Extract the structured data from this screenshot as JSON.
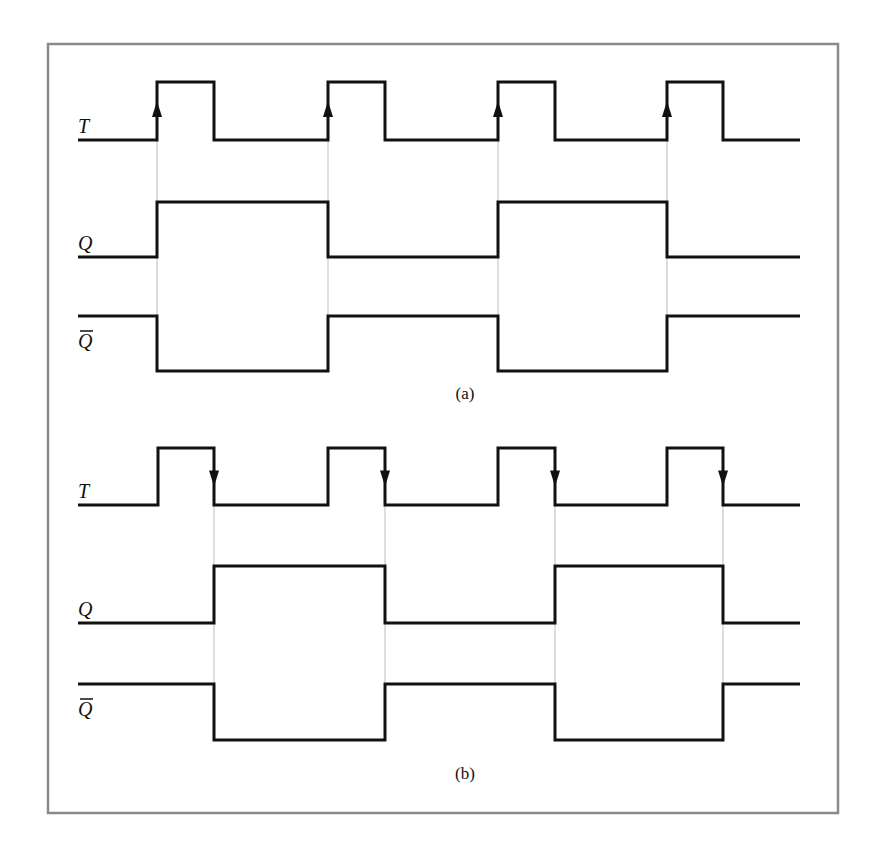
{
  "frame": {
    "x": 48,
    "y": 44,
    "width": 790,
    "height": 769,
    "stroke": "#8a8a8a"
  },
  "signal_x_start": 78,
  "signal_x_end": 800,
  "panels": [
    {
      "caption": "(a)",
      "caption_pos": {
        "x": 465,
        "y": 399
      },
      "trigger": "rising-edge",
      "clock_edges": [
        157,
        328,
        498,
        667
      ],
      "signals": [
        {
          "label": "T",
          "label_pos": {
            "x": 78,
            "y": 133
          },
          "bar": false,
          "high_y": 82,
          "low_y": 140,
          "initial": 0,
          "transitions": [
            157,
            214,
            328,
            385,
            498,
            555,
            667,
            723
          ]
        },
        {
          "label": "Q",
          "label_pos": {
            "x": 78,
            "y": 250
          },
          "bar": false,
          "high_y": 202,
          "low_y": 257,
          "initial": 0,
          "transitions": [
            157,
            328,
            498,
            667
          ]
        },
        {
          "label": "Q",
          "label_pos": {
            "x": 78,
            "y": 348
          },
          "bar": true,
          "high_y": 316,
          "low_y": 371,
          "initial": 1,
          "transitions": [
            157,
            328,
            498,
            667
          ]
        }
      ]
    },
    {
      "caption": "(b)",
      "caption_pos": {
        "x": 465,
        "y": 779
      },
      "trigger": "falling-edge",
      "clock_edges": [
        214,
        385,
        555,
        723
      ],
      "signals": [
        {
          "label": "T",
          "label_pos": {
            "x": 78,
            "y": 498
          },
          "bar": false,
          "high_y": 448,
          "low_y": 505,
          "initial": 0,
          "transitions": [
            158,
            214,
            328,
            385,
            498,
            555,
            667,
            723
          ]
        },
        {
          "label": "Q",
          "label_pos": {
            "x": 78,
            "y": 616
          },
          "bar": false,
          "high_y": 566,
          "low_y": 623,
          "initial": 0,
          "transitions": [
            214,
            385,
            555,
            723
          ]
        },
        {
          "label": "Q",
          "label_pos": {
            "x": 78,
            "y": 716
          },
          "bar": true,
          "high_y": 684,
          "low_y": 740,
          "initial": 1,
          "transitions": [
            214,
            385,
            555,
            723
          ]
        }
      ]
    }
  ]
}
